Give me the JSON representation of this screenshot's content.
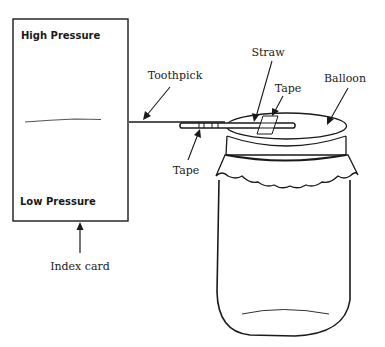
{
  "index_card": {
    "top_label": "High Pressure",
    "bottom_label": "Low Pressure",
    "caption": "Index card"
  },
  "callouts": {
    "toothpick": "Toothpick",
    "straw": "Straw",
    "tape_top": "Tape",
    "balloon": "Balloon",
    "tape_bottom": "Tape"
  },
  "colors": {
    "ink": "#1a1a1a",
    "background": "#ffffff"
  }
}
